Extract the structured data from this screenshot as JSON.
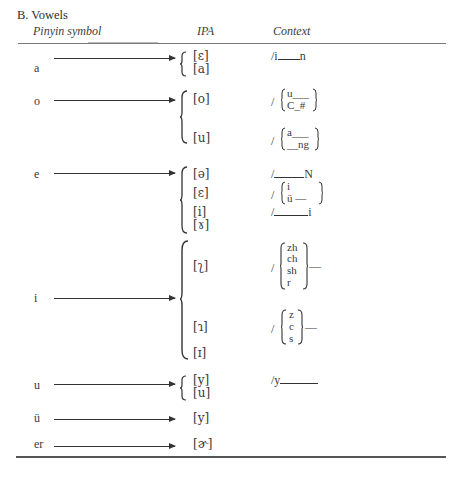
{
  "section": {
    "title": "B. Vowels"
  },
  "columns": {
    "pinyin": "Pinyin symbol",
    "ipa": "IPA",
    "context": "Context"
  },
  "rows": [
    {
      "pinyin": "a",
      "ipa": [
        "[ɛ]",
        "[a]"
      ],
      "context": [
        {
          "prefix": "/i",
          "suffix": "n"
        }
      ]
    },
    {
      "pinyin": "o",
      "ipa": [
        "[o]",
        "[u]"
      ],
      "context": [
        {
          "prefix": "/",
          "options": [
            "u___",
            "C_#"
          ]
        },
        {
          "prefix": "/",
          "options": [
            "a___",
            "__ng"
          ]
        }
      ]
    },
    {
      "pinyin": "e",
      "ipa": [
        "[ə]",
        "[ɛ]",
        "[i]",
        "[ɤ]"
      ],
      "context": [
        {
          "prefix": "/",
          "suffix": "N"
        },
        {
          "prefix": "/",
          "options": [
            "i",
            "ü —"
          ]
        },
        {
          "prefix": "/",
          "suffix": "i"
        }
      ]
    },
    {
      "pinyin": "i",
      "ipa": [
        "[ʅ]",
        "[ɿ]",
        "[ɪ]"
      ],
      "context": [
        {
          "prefix": "/",
          "options": [
            "zh",
            "ch",
            "sh",
            "r"
          ],
          "suffix": "—"
        },
        {
          "prefix": "/",
          "options": [
            "z",
            "c",
            "s"
          ],
          "suffix": "—"
        }
      ]
    },
    {
      "pinyin": "u",
      "ipa": [
        "[y]",
        "[u]"
      ],
      "context": [
        {
          "prefix": "/y",
          "suffix": ""
        }
      ]
    },
    {
      "pinyin": "ü",
      "ipa": [
        "[y]"
      ],
      "context": []
    },
    {
      "pinyin": "er",
      "ipa": [
        "[ɚ]"
      ],
      "context": []
    }
  ]
}
